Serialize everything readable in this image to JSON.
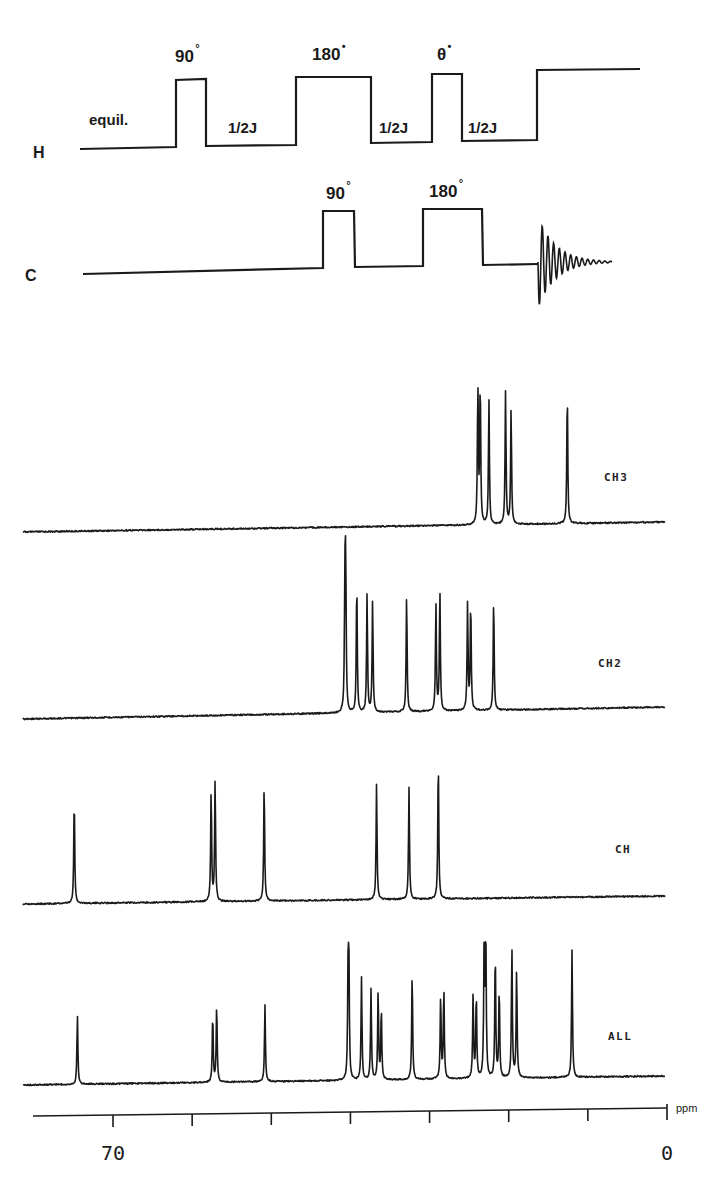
{
  "pulse_sequence": {
    "channels": [
      {
        "name": "H",
        "label_pos": [
          33,
          158
        ],
        "path": [
          [
            80,
            149
          ],
          [
            176,
            147
          ],
          [
            176,
            80
          ],
          [
            206,
            79
          ],
          [
            206,
            146
          ],
          [
            296,
            145
          ],
          [
            296,
            77
          ],
          [
            371,
            77
          ],
          [
            371,
            143
          ],
          [
            432,
            142
          ],
          [
            432,
            74
          ],
          [
            462,
            74
          ],
          [
            462,
            141
          ],
          [
            537,
            140
          ],
          [
            537,
            70
          ],
          [
            640,
            69
          ]
        ],
        "pulses": [
          {
            "angle": "90",
            "deg": "°",
            "pos": [
              175,
              62
            ]
          },
          {
            "angle": "180",
            "deg": "•",
            "pos": [
              312,
              60
            ]
          },
          {
            "angle": "θ",
            "deg": "•",
            "pos": [
              437,
              60
            ]
          }
        ],
        "delays": [
          {
            "text": "equil.",
            "pos": [
              89,
              125
            ]
          },
          {
            "text": "1/2J",
            "pos": [
              228,
              133
            ]
          },
          {
            "text": "1/2J",
            "pos": [
              379,
              133
            ]
          },
          {
            "text": "1/2J",
            "pos": [
              468,
              133
            ]
          }
        ]
      },
      {
        "name": "C",
        "label_pos": [
          25,
          281
        ],
        "path": [
          [
            83,
            274
          ],
          [
            323,
            268
          ],
          [
            323,
            211
          ],
          [
            354,
            211
          ],
          [
            355,
            267
          ],
          [
            423,
            266
          ],
          [
            423,
            209
          ],
          [
            482,
            209
          ],
          [
            483,
            265
          ],
          [
            538,
            264
          ]
        ],
        "pulses": [
          {
            "angle": "90",
            "deg": "°",
            "pos": [
              326,
              199
            ]
          },
          {
            "angle": "180",
            "deg": "°",
            "pos": [
              429,
              197
            ]
          }
        ],
        "fid": {
          "start_x": 538,
          "end_x": 612,
          "center_y": 262,
          "amplitude": 46
        }
      }
    ]
  },
  "chart_data": {
    "type": "line",
    "xlabel": "ppm",
    "ylabel": "",
    "x_axis": {
      "range_ppm": [
        80,
        0
      ],
      "reversed": true,
      "ticks_ppm": [
        70,
        60,
        50,
        40,
        30,
        20,
        10,
        0
      ],
      "tick_labels": [
        {
          "ppm": 70,
          "text": "70"
        },
        {
          "ppm": 0,
          "text": "0"
        }
      ],
      "unit": "ppm"
    },
    "grid": false,
    "series": [
      {
        "name": "CH3",
        "baseline_y": [
          532,
          522
        ],
        "peaks": [
          {
            "ppm": 23.9,
            "height": 138
          },
          {
            "ppm": 23.6,
            "height": 142
          },
          {
            "ppm": 22.5,
            "height": 125
          },
          {
            "ppm": 20.4,
            "height": 134
          },
          {
            "ppm": 19.7,
            "height": 116
          },
          {
            "ppm": 12.6,
            "height": 133
          }
        ]
      },
      {
        "name": "CH2",
        "baseline_y": [
          719,
          707
        ],
        "peaks": [
          {
            "ppm": 40.7,
            "height": 117
          },
          {
            "ppm": 40.6,
            "height": 138
          },
          {
            "ppm": 39.2,
            "height": 133
          },
          {
            "ppm": 37.9,
            "height": 119
          },
          {
            "ppm": 37.2,
            "height": 113
          },
          {
            "ppm": 32.9,
            "height": 118
          },
          {
            "ppm": 29.2,
            "height": 108
          },
          {
            "ppm": 28.7,
            "height": 122
          },
          {
            "ppm": 25.2,
            "height": 108
          },
          {
            "ppm": 24.8,
            "height": 110
          },
          {
            "ppm": 21.9,
            "height": 113
          }
        ]
      },
      {
        "name": "CH",
        "baseline_y": [
          904,
          896
        ],
        "peaks": [
          {
            "ppm": 74.9,
            "height": 107
          },
          {
            "ppm": 57.6,
            "height": 113
          },
          {
            "ppm": 57.1,
            "height": 123
          },
          {
            "ppm": 50.9,
            "height": 119
          },
          {
            "ppm": 36.7,
            "height": 117
          },
          {
            "ppm": 32.6,
            "height": 112
          },
          {
            "ppm": 28.9,
            "height": 142
          }
        ]
      },
      {
        "name": "ALL",
        "baseline_y": [
          1085,
          1076
        ],
        "peaks": [
          {
            "ppm": 74.5,
            "height": 70
          },
          {
            "ppm": 57.4,
            "height": 69
          },
          {
            "ppm": 56.9,
            "height": 79
          },
          {
            "ppm": 50.8,
            "height": 77
          },
          {
            "ppm": 40.3,
            "height": 97
          },
          {
            "ppm": 40.2,
            "height": 111
          },
          {
            "ppm": 38.6,
            "height": 103
          },
          {
            "ppm": 37.4,
            "height": 91
          },
          {
            "ppm": 36.5,
            "height": 89
          },
          {
            "ppm": 36.1,
            "height": 72
          },
          {
            "ppm": 32.2,
            "height": 108
          },
          {
            "ppm": 28.6,
            "height": 84
          },
          {
            "ppm": 28.2,
            "height": 92
          },
          {
            "ppm": 24.5,
            "height": 84
          },
          {
            "ppm": 24.1,
            "height": 85
          },
          {
            "ppm": 23.1,
            "height": 137
          },
          {
            "ppm": 22.9,
            "height": 143
          },
          {
            "ppm": 21.7,
            "height": 128
          },
          {
            "ppm": 21.2,
            "height": 91
          },
          {
            "ppm": 19.6,
            "height": 132
          },
          {
            "ppm": 19.0,
            "height": 110
          },
          {
            "ppm": 12.0,
            "height": 128
          }
        ]
      }
    ],
    "labels": [
      {
        "series": "CH3",
        "text": "CH3",
        "pos": [
          604,
          481
        ]
      },
      {
        "series": "CH2",
        "text": "CH2",
        "pos": [
          598,
          667
        ]
      },
      {
        "series": "CH",
        "text": "CH",
        "pos": [
          615,
          853
        ]
      },
      {
        "series": "ALL",
        "text": "ALL",
        "pos": [
          608,
          1040
        ]
      }
    ]
  },
  "layout": {
    "px_per_ppm": 7.914,
    "zero_ppm_x": 667,
    "spectrum_x_start": 23,
    "spectrum_x_end": 665,
    "axis": {
      "y_left": 1116,
      "y_right": 1108,
      "x_left": 33,
      "x_right": 667,
      "tick_len": 12
    },
    "ink_color": "#1a1a1a"
  }
}
